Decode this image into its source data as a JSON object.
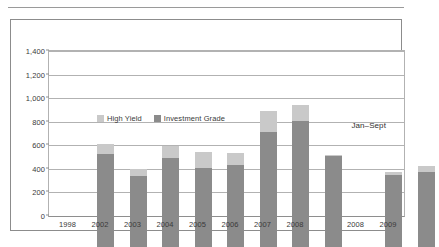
{
  "figure": {
    "annotation": "Jan–Sept"
  },
  "legend": {
    "position": "inside-top-left",
    "items": [
      {
        "label": "High Yield",
        "color": "#c9c9c9"
      },
      {
        "label": "Investment Grade",
        "color": "#8b8b8b"
      }
    ]
  },
  "chart_data": {
    "type": "bar",
    "stacked": true,
    "title": "",
    "subtitle": "",
    "xlabel": "",
    "ylabel": "",
    "ylim": [
      0,
      1400
    ],
    "yticks": [
      0,
      200,
      400,
      600,
      800,
      1000,
      1200,
      1400
    ],
    "ytick_labels": [
      "0",
      "200",
      "400",
      "600",
      "800",
      "1,000",
      "1,200",
      "1,400"
    ],
    "grid": true,
    "categories": [
      "1998",
      "2002",
      "2003",
      "2004",
      "2005",
      "2006",
      "2007",
      "2008",
      "2008",
      "2009"
    ],
    "group_gap_after_index": 7,
    "group_labels": [
      "Full year",
      "Jan–Sept"
    ],
    "series": [
      {
        "name": "Investment Grade",
        "color": "#8b8b8b",
        "values": [
          790,
          600,
          755,
          670,
          700,
          980,
          1070,
          775,
          615,
          640
        ]
      },
      {
        "name": "High Yield",
        "color": "#c9c9c9",
        "values": [
          80,
          65,
          100,
          140,
          95,
          170,
          135,
          5,
          25,
          45
        ]
      }
    ],
    "totals": [
      870,
      665,
      855,
      810,
      795,
      1150,
      1205,
      780,
      640,
      685
    ]
  }
}
